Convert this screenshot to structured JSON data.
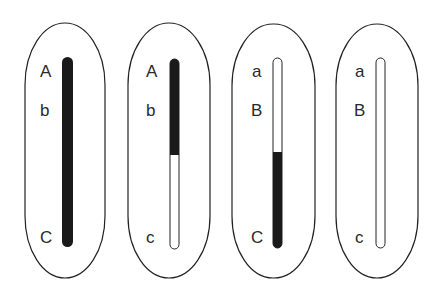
{
  "diagram": {
    "colors": {
      "filled": "#1a1a1a",
      "empty": "#ffffff",
      "outline": "#222222"
    },
    "cells": [
      {
        "id": "cell-1",
        "labels": [
          "A",
          "b",
          "C"
        ],
        "fill": "full"
      },
      {
        "id": "cell-2",
        "labels": [
          "A",
          "b",
          "c"
        ],
        "fill": "top"
      },
      {
        "id": "cell-3",
        "labels": [
          "a",
          "B",
          "C"
        ],
        "fill": "bottom"
      },
      {
        "id": "cell-4",
        "labels": [
          "a",
          "B",
          "c"
        ],
        "fill": "none"
      }
    ]
  }
}
